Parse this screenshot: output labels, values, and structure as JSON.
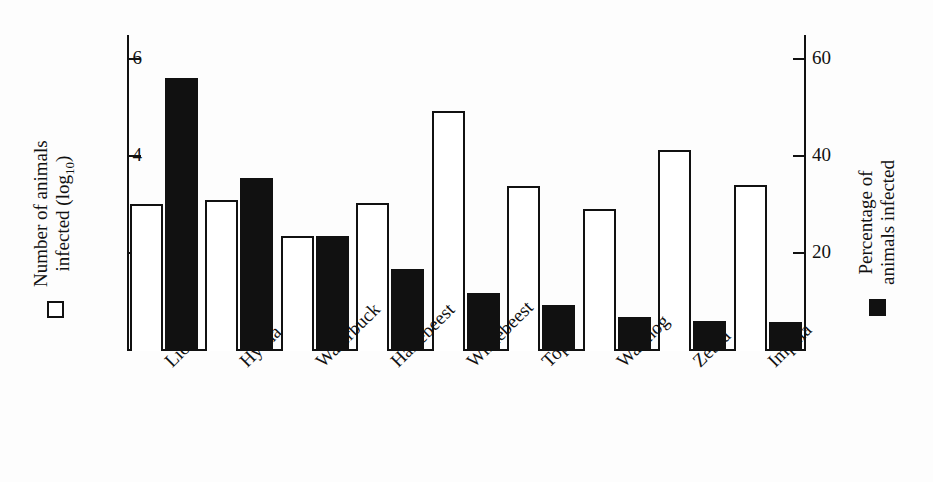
{
  "chart_data": {
    "type": "bar",
    "title": "",
    "xlabel": "",
    "categories": [
      "Lion",
      "Hyena",
      "Waterbuck",
      "Hartebeest",
      "Wildebeest",
      "Topi",
      "Warthog",
      "Zebra",
      "Impala"
    ],
    "grid": false,
    "legend_position": "outside-left-and-right",
    "series": [
      {
        "name": "Number of animals infected (log10)",
        "marker": "open-square",
        "axis": "left",
        "ylabel": "Number of animals infected (log10)",
        "ylim": [
          0,
          6.5
        ],
        "yticks": [
          2,
          4,
          6
        ],
        "values": [
          3.03,
          3.11,
          2.37,
          3.05,
          4.95,
          3.4,
          2.93,
          4.14,
          3.42
        ]
      },
      {
        "name": "Percentage of animals infected",
        "marker": "filled-square",
        "axis": "right",
        "ylabel": "Percentage of animals infected",
        "ylim": [
          0,
          65
        ],
        "yticks": [
          20,
          40,
          60
        ],
        "values": [
          56.3,
          35.7,
          23.7,
          16.9,
          12.0,
          9.5,
          7.0,
          6.2,
          6.0
        ]
      }
    ]
  },
  "axes": {
    "left": {
      "tick_labels": [
        "6",
        "4",
        "2"
      ],
      "legend_line1": "Number of animals",
      "legend_line2": "infected (log",
      "legend_sub": "10",
      "legend_line2_end": ")"
    },
    "right": {
      "tick_labels": [
        "60",
        "40",
        "20"
      ],
      "legend_line1": "Percentage of",
      "legend_line2": "animals infected"
    }
  },
  "colors": {
    "ink": "#111111",
    "open_bar_fill": "#ffffff",
    "filled_bar": "#111111",
    "background": "#fdfdfd"
  }
}
